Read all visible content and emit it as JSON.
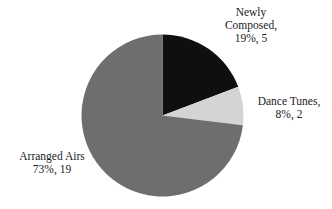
{
  "chart_data": {
    "type": "pie",
    "title": "",
    "categories": [
      "Newly Composed",
      "Dance Tunes",
      "Arranged Airs"
    ],
    "values": [
      5,
      2,
      19
    ],
    "percentages": [
      19,
      8,
      73
    ],
    "colors": [
      "#0f0f0f",
      "#d4d4d4",
      "#6e6e6e"
    ],
    "start_angle_deg": 0,
    "direction": "clockwise",
    "legend": "none",
    "labels": [
      {
        "lines": [
          "Newly",
          "Composed,",
          "19%, 5"
        ]
      },
      {
        "lines": [
          "Dance Tunes,",
          "8%, 2"
        ]
      },
      {
        "lines": [
          "Arranged Airs",
          "73%, 19"
        ]
      }
    ]
  }
}
